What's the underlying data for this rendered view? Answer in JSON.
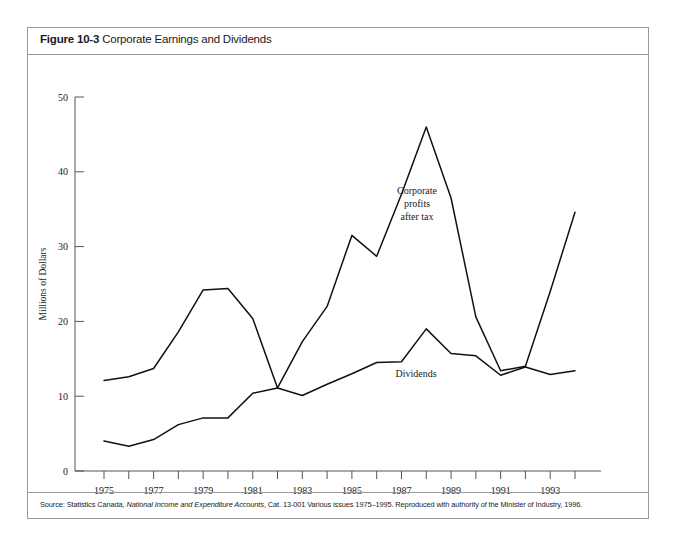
{
  "figure": {
    "number": "Figure 10-3",
    "title": "Corporate Earnings and Dividends",
    "source_prefix": "Source: Statistics Canada, ",
    "source_italic": "National Income and Expenditure Accounts",
    "source_suffix": ", Cat. 13-001 Various issues 1975–1995. Reproduced with authority of the Minister of Industry, 1996."
  },
  "chart_data": {
    "type": "line",
    "title": "Corporate Earnings and Dividends",
    "xlabel": "Years",
    "ylabel": "Millions of Dollars",
    "xlim": [
      1975,
      1994
    ],
    "ylim": [
      0,
      50
    ],
    "grid": false,
    "legend": "inline-annotations",
    "x": [
      1975,
      1976,
      1977,
      1978,
      1979,
      1980,
      1981,
      1982,
      1983,
      1984,
      1985,
      1986,
      1987,
      1988,
      1989,
      1990,
      1991,
      1992,
      1993,
      1994
    ],
    "categories": [
      "1975",
      "1976",
      "1977",
      "1978",
      "1979",
      "1980",
      "1981",
      "1982",
      "1983",
      "1984",
      "1985",
      "1986",
      "1987",
      "1988",
      "1989",
      "1990",
      "1991",
      "1992",
      "1993",
      "1994"
    ],
    "yticks": [
      0,
      10,
      20,
      30,
      40,
      50
    ],
    "ytick_labels": [
      "0",
      "10",
      "20",
      "30",
      "40",
      "50"
    ],
    "series": [
      {
        "name": "Corporate profits after tax",
        "annotation_lines": [
          "Corporate",
          "profits",
          "after tax"
        ],
        "values": [
          12.1,
          12.6,
          13.7,
          18.6,
          24.2,
          24.4,
          20.4,
          11.1,
          17.3,
          22.0,
          31.5,
          28.7,
          37.0,
          46.0,
          36.5,
          20.6,
          13.4,
          14.0,
          24.0,
          34.6
        ]
      },
      {
        "name": "Dividends",
        "annotation_lines": [
          "Dividends"
        ],
        "values": [
          4.0,
          3.3,
          4.2,
          6.2,
          7.1,
          7.1,
          10.4,
          11.1,
          10.1,
          11.6,
          13.0,
          14.5,
          14.6,
          19.0,
          15.7,
          15.4,
          12.8,
          13.9,
          12.9,
          13.4
        ]
      }
    ]
  },
  "axis": {
    "y_title": "Millions of Dollars",
    "x_title": "Years"
  }
}
